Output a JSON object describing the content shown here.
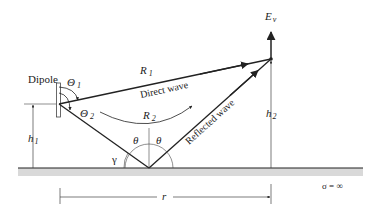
{
  "diagram": {
    "labels": {
      "dipole": "Dipole",
      "theta1": "Θ",
      "theta1_sub": "1",
      "theta2": "Θ",
      "theta2_sub": "2",
      "r1": "R",
      "r1_sub": "1",
      "r2": "R",
      "r2_sub": "2",
      "direct_wave": "Direct wave",
      "reflected_wave": "Reflected wave",
      "ev": "E",
      "ev_sub": "v",
      "h1": "h",
      "h1_sub": "1",
      "h2": "h",
      "h2_sub": "2",
      "theta_left": "θ",
      "theta_right": "θ",
      "gamma": "γ",
      "r": "r",
      "sigma": "σ = ∞"
    },
    "colors": {
      "line": "#222222",
      "ground_fill": "#d9d9d9",
      "background": "#ffffff"
    }
  }
}
